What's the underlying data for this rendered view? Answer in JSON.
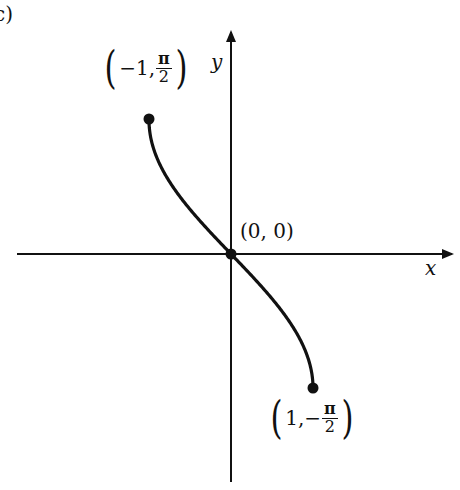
{
  "panel_label": "c)",
  "chart_data": {
    "type": "line",
    "title": "",
    "function": "y = -arcsin(x)",
    "xlabel": "x",
    "ylabel": "y",
    "xlim": [
      -1,
      1
    ],
    "ylim": [
      -1.5708,
      1.5708
    ],
    "grid": false,
    "legend": null,
    "series": [
      {
        "name": "curve",
        "x": [
          -1,
          -0.75,
          -0.5,
          -0.25,
          0,
          0.25,
          0.5,
          0.75,
          1
        ],
        "y": [
          1.5708,
          0.8481,
          0.5236,
          0.2527,
          0,
          -0.2527,
          -0.5236,
          -0.8481,
          -1.5708
        ]
      }
    ],
    "points": [
      {
        "label": "(-1, π/2)",
        "x": -1,
        "y": 1.5708
      },
      {
        "label": "(0, 0)",
        "x": 0,
        "y": 0
      },
      {
        "label": "(1, -π/2)",
        "x": 1,
        "y": -1.5708
      }
    ],
    "annotations": [
      {
        "text_left": "−1,",
        "frac_num": "π",
        "frac_den": "2",
        "anchor": "top-left-endpoint"
      },
      {
        "text": "(0, 0)",
        "anchor": "origin"
      },
      {
        "text_left": "1,−",
        "frac_num": "π",
        "frac_den": "2",
        "anchor": "bottom-right-endpoint"
      }
    ]
  },
  "labels": {
    "x_axis": "x",
    "y_axis": "y",
    "origin": "(0, 0)",
    "p1_left": "−1,",
    "p1_num": "π",
    "p1_den": "2",
    "p3_left": "1,−",
    "p3_num": "π",
    "p3_den": "2",
    "open_paren": "(",
    "close_paren": ")"
  },
  "colors": {
    "ink": "#111111",
    "background": "#ffffff"
  }
}
